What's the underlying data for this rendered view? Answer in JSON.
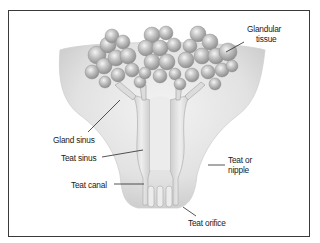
{
  "diagram": {
    "labels": {
      "glandular_tissue_line1": "Glandular",
      "glandular_tissue_line2": "tissue",
      "gland_sinus": "Gland sinus",
      "teat_sinus": "Teat sinus",
      "teat_canal": "Teat canal",
      "teat_or_nipple_line1": "Teat or",
      "teat_or_nipple_line2": "nipple",
      "teat_orifice": "Teat orifice"
    },
    "colors": {
      "border": "#3a3a3a",
      "body_fill": "#e6e6e6",
      "body_shadow": "#c8c8c8",
      "alveoli": "#b5b5b5",
      "alveoli_highlight": "#f2f2f2",
      "leader_line": "#2a2a2a"
    }
  }
}
